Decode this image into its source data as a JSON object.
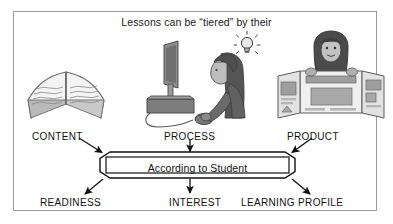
{
  "diagram": {
    "title": "Lessons can be “tiered” by their",
    "center_box": {
      "label": "According to Student"
    },
    "top_categories": [
      {
        "id": "content",
        "label": "CONTENT",
        "icon": "open-book-icon"
      },
      {
        "id": "process",
        "label": "PROCESS",
        "icon": "student-at-computer-icon"
      },
      {
        "id": "product",
        "label": "PRODUCT",
        "icon": "student-with-display-board-icon"
      }
    ],
    "bottom_categories": [
      {
        "id": "readiness",
        "label": "READINESS"
      },
      {
        "id": "interest",
        "label": "INTEREST"
      },
      {
        "id": "profile",
        "label": "LEARNING PROFILE"
      }
    ],
    "illustrations": [
      {
        "id": "book",
        "name": "open-book-illustration",
        "depicts": "open book with lines of text"
      },
      {
        "id": "computer",
        "name": "student-at-computer-illustration",
        "depicts": "student using a desktop monitor and mouse with a light bulb idea"
      },
      {
        "id": "poster",
        "name": "student-with-display-board-illustration",
        "depicts": "student behind a tri-fold presentation board"
      }
    ],
    "colors": {
      "frame_border": "#9a9a9a",
      "line": "#111111",
      "text": "#141414",
      "art_fill": "#8e8e8e",
      "art_dark": "#5a5a5a",
      "art_light": "#d6d6d6",
      "background": "#ffffff"
    }
  }
}
